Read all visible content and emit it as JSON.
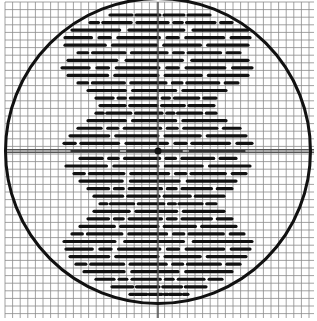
{
  "figure": {
    "width": 317,
    "height": 321,
    "background": "#ffffff",
    "grid": {
      "x0": 5,
      "y0": 2,
      "x1": 314,
      "y1": 318,
      "step": 7.6,
      "color": "#8a8a8a",
      "width": 0.8
    },
    "circle": {
      "cx": 158,
      "cy": 151,
      "r": 152.5,
      "stroke": "#111111",
      "width": 3
    },
    "crosshair": {
      "x": 158,
      "y": 151,
      "color": "#555555",
      "width": 1.5,
      "double_horizontal": true
    },
    "center_dot": {
      "r": 3.5,
      "color": "#111111"
    },
    "dash_pattern": {
      "color": "#111111",
      "thickness": 3.2,
      "row_start_y": 15,
      "row_step": 7.55,
      "rows": [
        {
          "l": 110,
          "r": 210
        },
        {
          "l": 90,
          "r": 232
        },
        {
          "l": 72,
          "r": 248
        },
        {
          "l": 65,
          "r": 250
        },
        {
          "l": 65,
          "r": 248
        },
        {
          "l": 78,
          "r": 240
        },
        {
          "l": 68,
          "r": 248
        },
        {
          "l": 62,
          "r": 252
        },
        {
          "l": 68,
          "r": 248
        },
        {
          "l": 78,
          "r": 238
        },
        {
          "l": 88,
          "r": 226
        },
        {
          "l": 96,
          "r": 216
        },
        {
          "l": 100,
          "r": 214
        },
        {
          "l": 96,
          "r": 216
        },
        {
          "l": 88,
          "r": 226
        },
        {
          "l": 78,
          "r": 240
        },
        {
          "l": 70,
          "r": 246
        },
        {
          "l": 64,
          "r": 252
        },
        {
          "l": 72,
          "r": 244
        },
        {
          "l": 80,
          "r": 236
        },
        {
          "l": 66,
          "r": 250
        },
        {
          "l": 74,
          "r": 246
        },
        {
          "l": 80,
          "r": 236
        },
        {
          "l": 88,
          "r": 232
        },
        {
          "l": 94,
          "r": 224
        },
        {
          "l": 100,
          "r": 216
        },
        {
          "l": 94,
          "r": 224
        },
        {
          "l": 88,
          "r": 232
        },
        {
          "l": 80,
          "r": 236
        },
        {
          "l": 72,
          "r": 244
        },
        {
          "l": 64,
          "r": 252
        },
        {
          "l": 66,
          "r": 250
        },
        {
          "l": 70,
          "r": 246
        },
        {
          "l": 76,
          "r": 240
        },
        {
          "l": 84,
          "r": 232
        },
        {
          "l": 96,
          "r": 222
        },
        {
          "l": 112,
          "r": 206
        },
        {
          "l": 130,
          "r": 188
        }
      ],
      "segment_patterns": [
        [
          0.22,
          0.04,
          0.24,
          0.04,
          0.2,
          0.04,
          0.22
        ],
        [
          0.06,
          0.03,
          0.2,
          0.04,
          0.22,
          0.04,
          0.06,
          0.03,
          0.2,
          0.04,
          0.08
        ],
        [
          0.26,
          0.05,
          0.3,
          0.05,
          0.3
        ],
        [
          0.14,
          0.04,
          0.06,
          0.04,
          0.22,
          0.04,
          0.06,
          0.04,
          0.2,
          0.04,
          0.1
        ]
      ]
    }
  }
}
